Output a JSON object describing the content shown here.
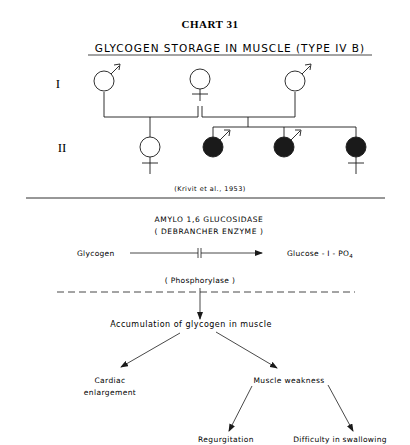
{
  "chart_label": "CHART 31",
  "title": "GLYCOGEN STORAGE IN MUSCLE (TYPE IV B)",
  "pedigree": {
    "generations": [
      {
        "label": "I",
        "members": [
          {
            "sex": "male",
            "affected": false
          },
          {
            "sex": "female",
            "affected": false
          },
          {
            "sex": "male",
            "affected": false
          }
        ]
      },
      {
        "label": "II",
        "members": [
          {
            "sex": "female",
            "affected": false
          },
          {
            "sex": "male",
            "affected": true
          },
          {
            "sex": "male",
            "affected": true
          },
          {
            "sex": "female",
            "affected": true
          }
        ]
      }
    ],
    "citation": "(Krivit et al., 1953)"
  },
  "pathway": {
    "enzyme_name": "AMYLO 1,6 GLUCOSIDASE",
    "enzyme_alias": "( DEBRANCHER ENZYME )",
    "substrate": "Glycogen",
    "product": "Glucose - I - PO",
    "product_subscript": "4",
    "second_enzyme": "( Phosphorylase )",
    "consequence": "Accumulation of glycogen in muscle",
    "effects": [
      {
        "label_line1": "Cardiac",
        "label_line2": "enlargement"
      },
      {
        "label_line1": "Muscle weakness",
        "label_line2": ""
      }
    ],
    "sub_effects": [
      "Regurgitation",
      "Difficulty in swallowing"
    ]
  },
  "colors": {
    "ink": "#1a1a1a",
    "background": "#ffffff"
  }
}
